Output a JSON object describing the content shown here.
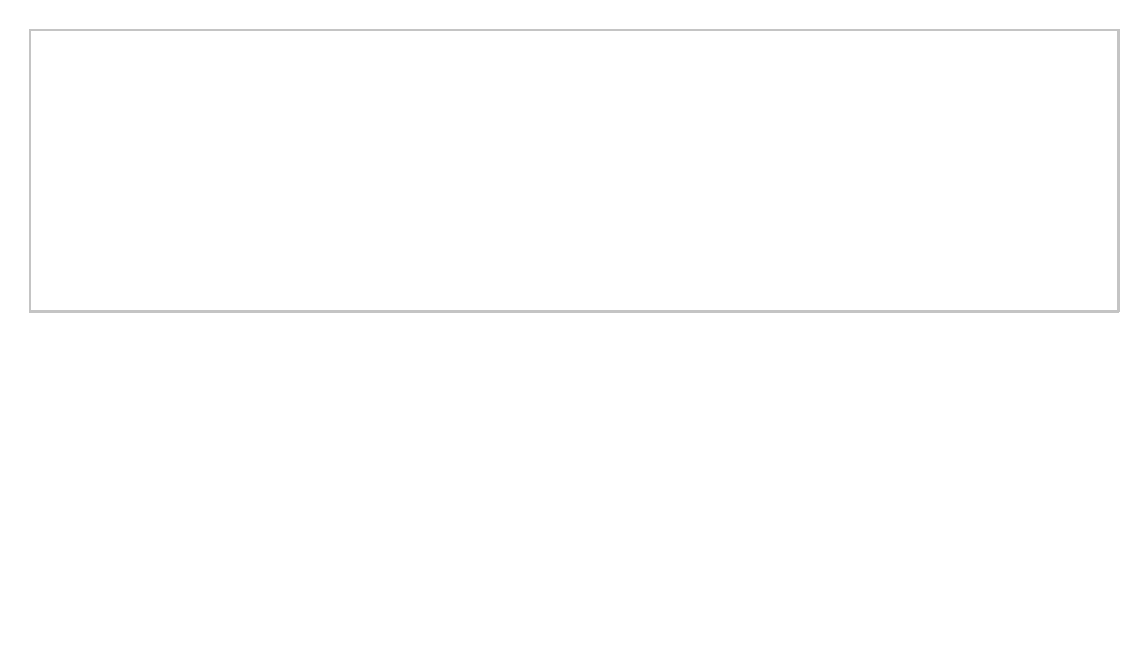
{
  "diagram": {
    "neighborhood_context": {
      "label": "Neighborhood Context"
    },
    "individual_characteristics": {
      "title": "Individual Characteristics",
      "description_line1": "(biological attributes/genetics, individual socioeconomic status,",
      "description_line2": "material resources, psychosocial resources, temperament, etc.)"
    },
    "environments": [
      {
        "title": "Structural Environment",
        "lines": [
          "(socioeconomic",
          "disadvantage, residential",
          "segregation, etc.)"
        ]
      },
      {
        "title": "Physical Environment",
        "lines": [
          "(environmental exposures,",
          "built environment,",
          "food/recreational",
          "resources, services,",
          "housing quality, etc.)"
        ]
      },
      {
        "title": "Social Environment",
        "lines": [
          "(collective efficacy, social",
          "support, informal social",
          "control, social capital, etc.)"
        ]
      }
    ],
    "exposures": [
      {
        "label": "Exposure to toxicants"
      },
      {
        "label": "Exposure to psychological stress"
      }
    ],
    "mediators": [
      {
        "label": "Behavioral mediators"
      },
      {
        "label_line1": "Physiological stress/",
        "label_line2": "immune response"
      }
    ],
    "outcome": {
      "label": "Health"
    },
    "colors": {
      "box_border": "#3a3a3a",
      "gray_fill": "#d6d6d6",
      "arrow_fill": "#333333",
      "block_arrow_fill": "#a8a8a8",
      "frame_border": "#c4c4c4",
      "dotted_border": "#9a9a9a"
    }
  }
}
